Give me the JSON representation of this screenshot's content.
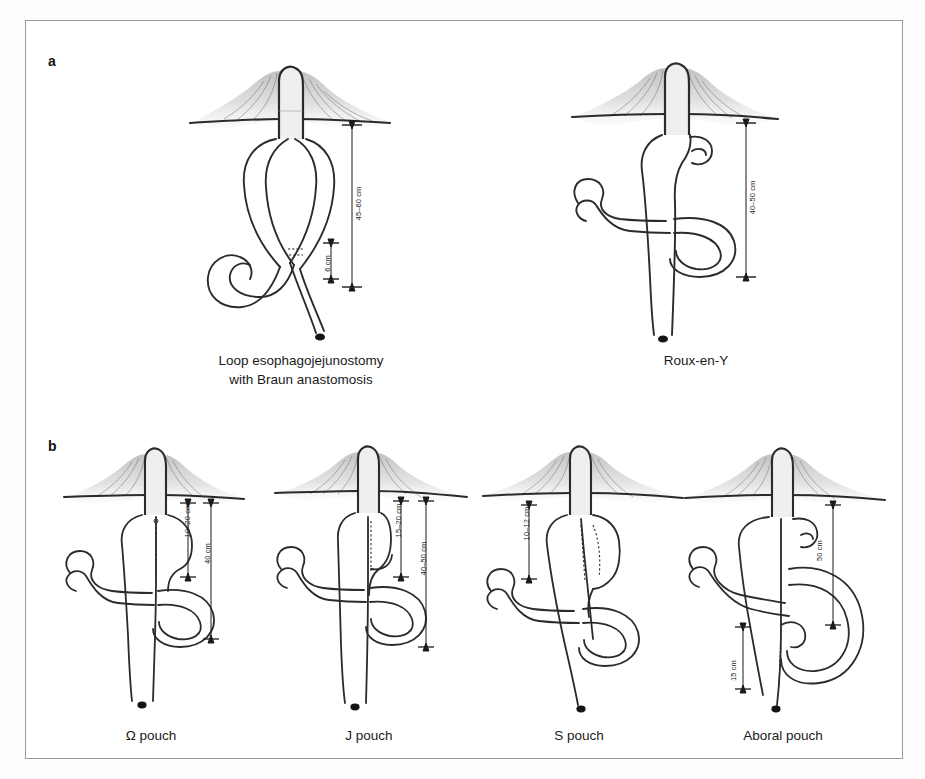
{
  "figure": {
    "background_color": "#ffffff",
    "frame_border_color": "#9a9a9a",
    "ink_color": "#1b1b1b"
  },
  "panels": [
    {
      "letter": "a",
      "diagrams": [
        {
          "name": "loop-esophagojejunostomy",
          "caption": "Loop esophagojejunostomy\nwith Braun anastomosis",
          "measurements": [
            {
              "label": "45–60 cm",
              "value_range": [
                45,
                60
              ],
              "unit": "cm"
            },
            {
              "label": "6 cm",
              "value_range": [
                6,
                6
              ],
              "unit": "cm"
            }
          ]
        },
        {
          "name": "roux-en-y",
          "caption": "Roux-en-Y",
          "measurements": [
            {
              "label": "40–50 cm",
              "value_range": [
                40,
                50
              ],
              "unit": "cm"
            }
          ]
        }
      ]
    },
    {
      "letter": "b",
      "diagrams": [
        {
          "name": "omega-pouch",
          "caption": "Ω pouch",
          "measurements": [
            {
              "label": "10–20 cm",
              "value_range": [
                10,
                20
              ],
              "unit": "cm"
            },
            {
              "label": "40 cm",
              "value_range": [
                40,
                40
              ],
              "unit": "cm"
            }
          ]
        },
        {
          "name": "j-pouch",
          "caption": "J pouch",
          "measurements": [
            {
              "label": "15–20 cm",
              "value_range": [
                15,
                20
              ],
              "unit": "cm"
            },
            {
              "label": "40–50 cm",
              "value_range": [
                40,
                50
              ],
              "unit": "cm"
            }
          ]
        },
        {
          "name": "s-pouch",
          "caption": "S pouch",
          "measurements": [
            {
              "label": "10–12 cm",
              "value_range": [
                10,
                12
              ],
              "unit": "cm"
            }
          ]
        },
        {
          "name": "aboral-pouch",
          "caption": "Aboral pouch",
          "measurements": [
            {
              "label": "50 cm",
              "value_range": [
                50,
                50
              ],
              "unit": "cm"
            },
            {
              "label": "15 cm",
              "value_range": [
                15,
                15
              ],
              "unit": "cm"
            }
          ]
        }
      ]
    }
  ],
  "labels": {
    "panel_a": "a",
    "panel_b": "b",
    "cap_loop": "Loop esophagojejunostomy\nwith Braun anastomosis",
    "cap_roux": "Roux-en-Y",
    "cap_omega": "Ω pouch",
    "cap_j": "J pouch",
    "cap_s": "S pouch",
    "cap_aboral": "Aboral pouch",
    "m_45_60": "45–60 cm",
    "m_6": "6 cm",
    "m_40_50_a": "40–50 cm",
    "m_10_20": "10–20 cm",
    "m_40": "40 cm",
    "m_15_20": "15–20 cm",
    "m_40_50_b": "40–50 cm",
    "m_10_12": "10–12 cm",
    "m_50": "50 cm",
    "m_15": "15 cm"
  }
}
